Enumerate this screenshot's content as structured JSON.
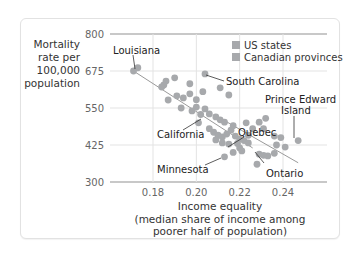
{
  "chart_data": {
    "type": "scatter",
    "title": "",
    "xlabel": "Income equality (median share of income among poorer half of population)",
    "xlabel_lines": [
      "Income equality",
      "(median share of income among",
      "poorer half of population)"
    ],
    "ylabel": "Mortality rate per 100,000 population",
    "ylabel_lines": [
      "Mortality",
      "rate per",
      "100,000",
      "population"
    ],
    "xlim": [
      0.163,
      0.258
    ],
    "ylim": [
      300,
      800
    ],
    "x_ticks": [
      0.18,
      0.2,
      0.22,
      0.24
    ],
    "x_tick_labels": [
      "0.18",
      "0.20",
      "0.22",
      "0.24"
    ],
    "y_ticks": [
      300,
      425,
      550,
      675,
      800
    ],
    "y_tick_labels": [
      "300",
      "425",
      "550",
      "675",
      "800"
    ],
    "grid": true,
    "legend": {
      "position": "upper right",
      "entries": [
        {
          "label": "US states",
          "color": "#a7a9ac"
        },
        {
          "label": "Canadian provinces",
          "color": "#a7a9ac"
        }
      ]
    },
    "trend_lines": [
      {
        "name": "US states fit",
        "x": [
          0.171,
          0.226
        ],
        "y": [
          675,
          415
        ]
      },
      {
        "name": "Canadian provinces fit",
        "x": [
          0.21,
          0.247
        ],
        "y": [
          520,
          365
        ]
      }
    ],
    "series": [
      {
        "name": "US states",
        "color": "#a7a9ac",
        "points": [
          {
            "x": 0.171,
            "y": 675,
            "label": "Louisiana"
          },
          {
            "x": 0.173,
            "y": 686
          },
          {
            "x": 0.186,
            "y": 641
          },
          {
            "x": 0.185,
            "y": 628
          },
          {
            "x": 0.184,
            "y": 621
          },
          {
            "x": 0.197,
            "y": 632
          },
          {
            "x": 0.204,
            "y": 665,
            "label": "South Carolina"
          },
          {
            "x": 0.19,
            "y": 652
          },
          {
            "x": 0.203,
            "y": 605
          },
          {
            "x": 0.191,
            "y": 591
          },
          {
            "x": 0.187,
            "y": 577
          },
          {
            "x": 0.194,
            "y": 584
          },
          {
            "x": 0.197,
            "y": 598
          },
          {
            "x": 0.211,
            "y": 618
          },
          {
            "x": 0.215,
            "y": 594
          },
          {
            "x": 0.2,
            "y": 578
          },
          {
            "x": 0.193,
            "y": 550
          },
          {
            "x": 0.2,
            "y": 553
          },
          {
            "x": 0.204,
            "y": 547
          },
          {
            "x": 0.198,
            "y": 540
          },
          {
            "x": 0.202,
            "y": 528,
            "label": "California"
          },
          {
            "x": 0.206,
            "y": 530
          },
          {
            "x": 0.209,
            "y": 520
          },
          {
            "x": 0.211,
            "y": 510
          },
          {
            "x": 0.213,
            "y": 502
          },
          {
            "x": 0.201,
            "y": 500
          },
          {
            "x": 0.206,
            "y": 480
          },
          {
            "x": 0.208,
            "y": 468
          },
          {
            "x": 0.21,
            "y": 458
          },
          {
            "x": 0.212,
            "y": 452
          },
          {
            "x": 0.214,
            "y": 462
          },
          {
            "x": 0.216,
            "y": 475
          },
          {
            "x": 0.218,
            "y": 455
          },
          {
            "x": 0.22,
            "y": 445
          },
          {
            "x": 0.209,
            "y": 442
          },
          {
            "x": 0.212,
            "y": 432
          },
          {
            "x": 0.215,
            "y": 428
          },
          {
            "x": 0.219,
            "y": 430
          },
          {
            "x": 0.222,
            "y": 440
          },
          {
            "x": 0.224,
            "y": 458
          },
          {
            "x": 0.22,
            "y": 415
          },
          {
            "x": 0.217,
            "y": 400
          },
          {
            "x": 0.221,
            "y": 405
          },
          {
            "x": 0.213,
            "y": 385,
            "label": "Minnesota"
          },
          {
            "x": 0.223,
            "y": 500
          },
          {
            "x": 0.226,
            "y": 480
          },
          {
            "x": 0.231,
            "y": 480
          },
          {
            "x": 0.229,
            "y": 502
          },
          {
            "x": 0.232,
            "y": 515
          },
          {
            "x": 0.217,
            "y": 490
          }
        ]
      },
      {
        "name": "Canadian provinces",
        "color": "#a7a9ac",
        "points": [
          {
            "x": 0.247,
            "y": 440,
            "label": "Prince Edward Island"
          },
          {
            "x": 0.224,
            "y": 432,
            "label": "Quebec"
          },
          {
            "x": 0.233,
            "y": 388,
            "label": "Ontario"
          },
          {
            "x": 0.229,
            "y": 394
          },
          {
            "x": 0.231,
            "y": 390
          },
          {
            "x": 0.236,
            "y": 397
          },
          {
            "x": 0.237,
            "y": 425
          },
          {
            "x": 0.241,
            "y": 418
          },
          {
            "x": 0.236,
            "y": 455
          },
          {
            "x": 0.239,
            "y": 450
          },
          {
            "x": 0.228,
            "y": 360
          }
        ]
      }
    ],
    "annotations": [
      {
        "text": "Louisiana",
        "x": 0.171,
        "y": 675
      },
      {
        "text": "South Carolina",
        "x": 0.204,
        "y": 665
      },
      {
        "text": "Prince Edward Island",
        "x": 0.247,
        "y": 440
      },
      {
        "text": "California",
        "x": 0.202,
        "y": 528
      },
      {
        "text": "Quebec",
        "x": 0.224,
        "y": 432
      },
      {
        "text": "Minnesota",
        "x": 0.213,
        "y": 385
      },
      {
        "text": "Ontario",
        "x": 0.233,
        "y": 388
      }
    ]
  },
  "labels": {
    "y_axis": [
      "Mortality",
      "rate per",
      "100,000",
      "population"
    ],
    "x_axis": [
      "Income equality",
      "(median share of income among",
      "poorer half of population)"
    ],
    "legend_us": "US states",
    "legend_ca": "Canadian provinces",
    "ann_louisiana": "Louisiana",
    "ann_south_carolina": "South Carolina",
    "ann_pei_1": "Prince Edward",
    "ann_pei_2": "Island",
    "ann_california": "California",
    "ann_quebec": "Quebec",
    "ann_minnesota": "Minnesota",
    "ann_ontario": "Ontario"
  }
}
